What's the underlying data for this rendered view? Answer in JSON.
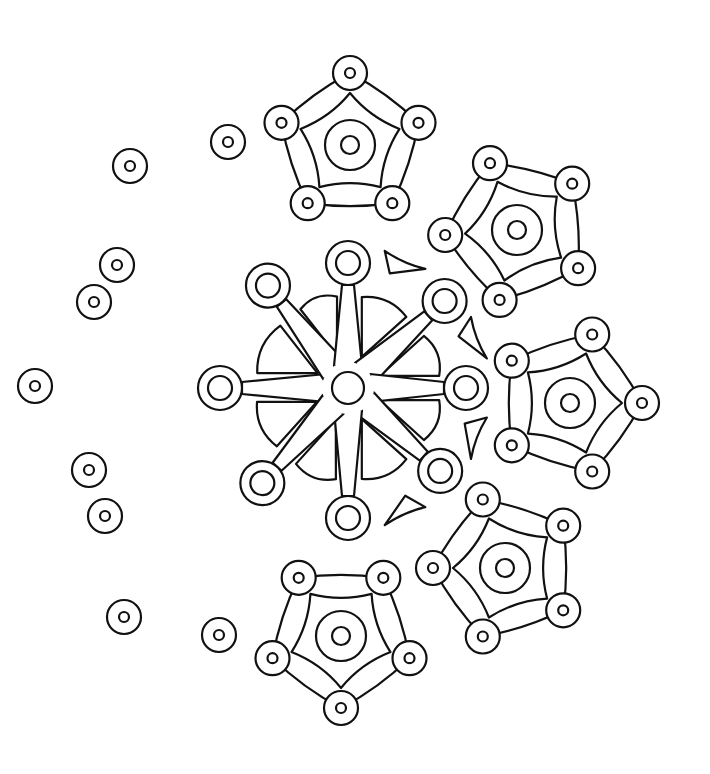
{
  "image": {
    "width": 710,
    "height": 774,
    "background": "#ffffff",
    "stroke": "#111111"
  },
  "scatter_beads": [
    {
      "cx": 130,
      "cy": 166,
      "r": 17,
      "ri": 5
    },
    {
      "cx": 117,
      "cy": 265,
      "r": 17,
      "ri": 5
    },
    {
      "cx": 94,
      "cy": 302,
      "r": 17,
      "ri": 5
    },
    {
      "cx": 35,
      "cy": 386,
      "r": 17,
      "ri": 5
    },
    {
      "cx": 89,
      "cy": 470,
      "r": 17,
      "ri": 5
    },
    {
      "cx": 105,
      "cy": 516,
      "r": 17,
      "ri": 5
    },
    {
      "cx": 124,
      "cy": 617,
      "r": 17,
      "ri": 5
    },
    {
      "cx": 219,
      "cy": 635,
      "r": 17,
      "ri": 5
    },
    {
      "cx": 228,
      "cy": 142,
      "r": 17,
      "ri": 5
    }
  ],
  "snowflake": {
    "cx": 348,
    "cy": 388,
    "hub_r": 16,
    "arms": [
      {
        "angle": 180,
        "len": 128
      },
      {
        "angle": -128,
        "len": 130
      },
      {
        "angle": -90,
        "len": 125
      },
      {
        "angle": -42,
        "len": 130
      },
      {
        "angle": 0,
        "len": 118
      },
      {
        "angle": 42,
        "len": 124
      },
      {
        "angle": 90,
        "len": 130
      },
      {
        "angle": 132,
        "len": 128
      }
    ],
    "arm_end_r": 22,
    "arm_end_inner_r": 12
  },
  "pentagons": [
    {
      "name": "top",
      "cx": 350,
      "cy": 145,
      "rot": -90
    },
    {
      "name": "upper-right",
      "cx": 517,
      "cy": 230,
      "rot": -40
    },
    {
      "name": "right",
      "cx": 570,
      "cy": 403,
      "rot": 0
    },
    {
      "name": "lower-right",
      "cx": 505,
      "cy": 568,
      "rot": 36
    },
    {
      "name": "bottom",
      "cx": 341,
      "cy": 636,
      "rot": 90
    }
  ],
  "pentagon_style": {
    "outer_r": 72,
    "inner_r": 52,
    "ring_r": 25,
    "dot_r": 9,
    "vertex_bead_r": 17,
    "vertex_bead_inner_r": 5
  }
}
